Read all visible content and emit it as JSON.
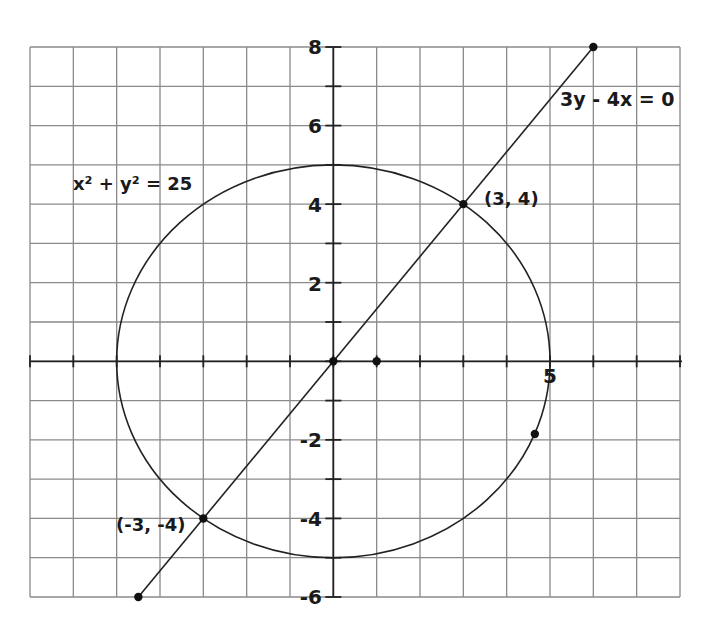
{
  "chart_data": {
    "type": "line",
    "title": "",
    "xlabel": "",
    "ylabel": "",
    "xlim": [
      -7,
      8
    ],
    "ylim": [
      -6,
      8
    ],
    "grid": true,
    "grid_step": 1,
    "x_tick_labels": [
      {
        "value": 5,
        "label": "5"
      }
    ],
    "y_tick_labels": [
      {
        "value": 8,
        "label": "8"
      },
      {
        "value": 6,
        "label": "6"
      },
      {
        "value": 4,
        "label": "4"
      },
      {
        "value": 2,
        "label": "2"
      },
      {
        "value": -2,
        "label": "-2"
      },
      {
        "value": -4,
        "label": "-4"
      },
      {
        "value": -6,
        "label": "-6"
      }
    ],
    "series": [
      {
        "name": "circle",
        "kind": "circle",
        "equation": "x² + y² = 25",
        "center": [
          0,
          0
        ],
        "radius": 5
      },
      {
        "name": "line",
        "kind": "segment",
        "equation": "3y - 4x = 0",
        "from": [
          -4.5,
          -6
        ],
        "to": [
          6,
          8
        ]
      }
    ],
    "points": [
      {
        "x": 6,
        "y": 8,
        "label": ""
      },
      {
        "x": 3,
        "y": 4,
        "label": "(3, 4)"
      },
      {
        "x": 0,
        "y": 0,
        "label": ""
      },
      {
        "x": 1,
        "y": 0,
        "label": ""
      },
      {
        "x": 4.65,
        "y": -1.85,
        "label": ""
      },
      {
        "x": -3,
        "y": -4,
        "label": "(-3, -4)"
      },
      {
        "x": -4.5,
        "y": -6,
        "label": ""
      }
    ],
    "annotations": [
      {
        "text": "x² + y² = 25",
        "x": -5.95,
        "y": 4.5
      },
      {
        "text": "3y - 4x = 0",
        "x": 5.0,
        "y": 5.7
      },
      {
        "text": "(3, 4)",
        "x": 3.55,
        "y": 4.0
      },
      {
        "text": "(-3, -4)",
        "x": -5.0,
        "y": -4.45
      }
    ]
  },
  "labels": {
    "circle_eq": "x² + y² = 25",
    "line_eq": "3y - 4x = 0",
    "pt_34": "(3, 4)",
    "pt_m3m4": "(-3, -4)",
    "x5": "5",
    "y8": "8",
    "y6": "6",
    "y4": "4",
    "y2": "2",
    "ym2": "-2",
    "ym4": "-4",
    "ym6": "-6"
  }
}
